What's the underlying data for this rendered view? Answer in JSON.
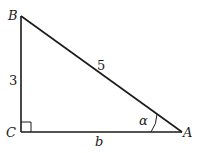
{
  "diagram": {
    "type": "right-triangle",
    "vertices": {
      "A": {
        "label": "A"
      },
      "B": {
        "label": "B"
      },
      "C": {
        "label": "C"
      }
    },
    "sides": {
      "BC": "3",
      "AB": "5",
      "CA": "b"
    },
    "angle_label": "α",
    "right_angle_at": "C",
    "line_color": "#1a1a1a"
  }
}
